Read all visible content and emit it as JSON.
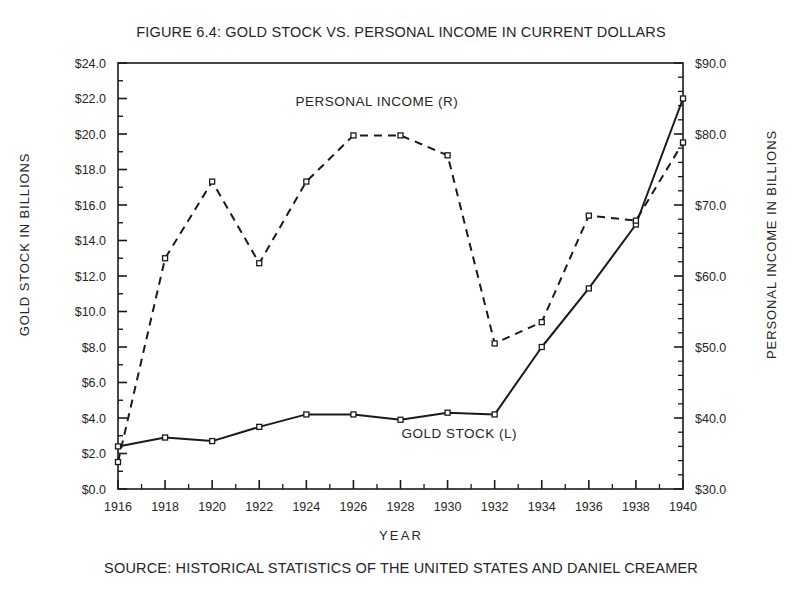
{
  "figure": {
    "title": "FIGURE 6.4: GOLD STOCK VS. PERSONAL INCOME IN CURRENT DOLLARS",
    "source": "SOURCE: HISTORICAL STATISTICS OF THE UNITED STATES AND DANIEL CREAMER",
    "xlabel": "YEAR",
    "ylabel_left": "GOLD STOCK IN BILLIONS",
    "ylabel_right": "PERSONAL INCOME IN BILLIONS"
  },
  "chart_data": {
    "type": "line",
    "title": "FIGURE 6.4: GOLD STOCK VS. PERSONAL INCOME IN CURRENT DOLLARS",
    "xlabel": "YEAR",
    "ylabel": "GOLD STOCK IN BILLIONS",
    "ylabel_right": "PERSONAL INCOME IN BILLIONS",
    "grid": false,
    "legend": "inline-annotation",
    "x": [
      1916,
      1917,
      1918,
      1919,
      1920,
      1921,
      1922,
      1923,
      1924,
      1925,
      1926,
      1927,
      1928,
      1929,
      1930,
      1931,
      1932,
      1933,
      1934,
      1935,
      1936,
      1937,
      1938,
      1939,
      1940
    ],
    "categories": [
      "1916",
      "1918",
      "1920",
      "1922",
      "1924",
      "1926",
      "1928",
      "1930",
      "1932",
      "1934",
      "1936",
      "1938",
      "1940"
    ],
    "xlim": [
      1916,
      1940
    ],
    "ylim_left": [
      0.0,
      24.0
    ],
    "ylim_right": [
      30.0,
      90.0
    ],
    "yticks_left": [
      "$0.0",
      "$2.0",
      "$4.0",
      "$6.0",
      "$8.0",
      "$10.0",
      "$12.0",
      "$14.0",
      "$16.0",
      "$18.0",
      "$20.0",
      "$22.0",
      "$24.0"
    ],
    "yticks_right": [
      "$30.0",
      "$40.0",
      "$50.0",
      "$60.0",
      "$70.0",
      "$80.0",
      "$90.0"
    ],
    "xticks": [
      "1916",
      "1918",
      "1920",
      "1922",
      "1924",
      "1926",
      "1928",
      "1930",
      "1932",
      "1934",
      "1936",
      "1938",
      "1940"
    ],
    "series": [
      {
        "name": "GOLD STOCK (L)",
        "axis": "left",
        "units": "billions of current dollars",
        "linestyle": "solid",
        "marker": "open-square",
        "x": [
          1916,
          1918,
          1920,
          1922,
          1924,
          1926,
          1928,
          1930,
          1932,
          1934,
          1936,
          1938,
          1940
        ],
        "values": [
          2.4,
          2.9,
          2.7,
          3.5,
          4.2,
          4.2,
          3.9,
          4.3,
          4.2,
          8.0,
          11.3,
          14.9,
          22.0
        ]
      },
      {
        "name": "PERSONAL INCOME (R)",
        "axis": "right",
        "units": "billions of current dollars",
        "linestyle": "dashed",
        "marker": "open-square",
        "x": [
          1916,
          1918,
          1920,
          1922,
          1924,
          1926,
          1928,
          1930,
          1932,
          1934,
          1936,
          1938,
          1940
        ],
        "values": [
          33.8,
          62.5,
          73.3,
          61.8,
          73.3,
          79.8,
          79.8,
          77.0,
          50.5,
          53.5,
          68.5,
          67.8,
          78.8
        ],
        "values_left_scale_equivalent": [
          1.5,
          13.0,
          17.3,
          12.7,
          17.2,
          19.8,
          19.8,
          18.8,
          8.2,
          9.4,
          15.4,
          15.1,
          19.5
        ]
      }
    ],
    "annotations": [
      {
        "text": "PERSONAL INCOME (R)",
        "x": 1927,
        "y_left_equiv": 21.6
      },
      {
        "text": "GOLD STOCK (L)",
        "x": 1930.5,
        "y_left_equiv": 2.9
      }
    ]
  }
}
